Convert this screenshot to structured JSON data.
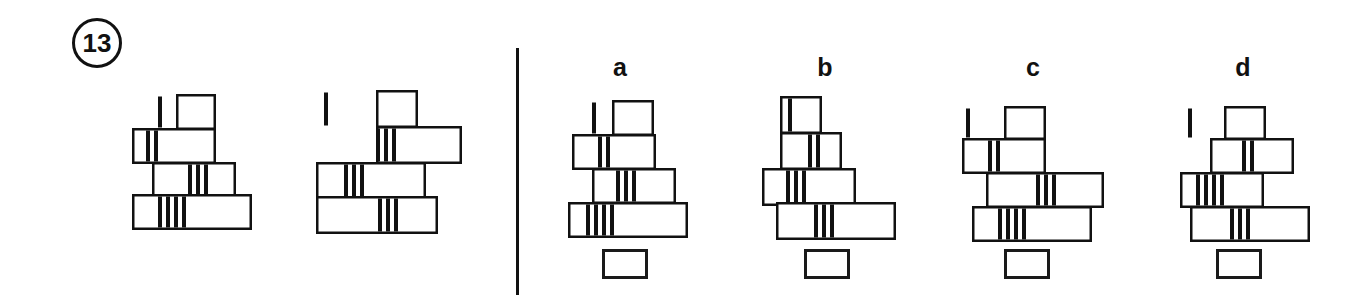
{
  "page": {
    "question_number": "13",
    "background_color": "#ffffff",
    "ink_color": "#111111",
    "width": 1368,
    "height": 295
  },
  "divider": {
    "x": 516,
    "y": 48,
    "width": 3,
    "height": 247
  },
  "question_marker": {
    "label": "13",
    "x": 72,
    "y": 18,
    "size": 50
  },
  "prompt": {
    "name": "prompt-figures",
    "figures": [
      {
        "name": "prompt-figure-1",
        "x": 128,
        "y": 94,
        "w": 132,
        "h": 132,
        "bricks": [
          {
            "name": "brick-top",
            "x": 48,
            "y": 0,
            "w": 40,
            "h": 36,
            "stripes": [
              30
            ]
          },
          {
            "name": "brick-second",
            "x": 4,
            "y": 34,
            "w": 84,
            "h": 36,
            "stripes": [
              18,
              26
            ]
          },
          {
            "name": "brick-third",
            "x": 24,
            "y": 68,
            "w": 84,
            "h": 36,
            "stripes": [
              60,
              68,
              76
            ]
          },
          {
            "name": "brick-bottom",
            "x": 4,
            "y": 100,
            "w": 120,
            "h": 36,
            "stripes": [
              30,
              38,
              46,
              54
            ]
          }
        ]
      },
      {
        "name": "prompt-figure-2",
        "x": 316,
        "y": 90,
        "w": 136,
        "h": 136,
        "bricks": [
          {
            "name": "brick-top",
            "x": 60,
            "y": 0,
            "w": 42,
            "h": 38,
            "stripes": [
              8
            ]
          },
          {
            "name": "brick-second",
            "x": 60,
            "y": 36,
            "w": 86,
            "h": 38,
            "stripes": [
              60,
              68,
              76
            ]
          },
          {
            "name": "brick-third",
            "x": 0,
            "y": 72,
            "w": 110,
            "h": 38,
            "stripes": [
              28,
              36,
              44
            ]
          },
          {
            "name": "brick-bottom",
            "x": 0,
            "y": 106,
            "w": 122,
            "h": 38,
            "stripes": [
              62,
              70,
              78
            ]
          }
        ]
      }
    ]
  },
  "options": [
    {
      "name": "option-a",
      "label": "a",
      "label_x": 605,
      "label_y": 55,
      "x": 568,
      "y": 100,
      "w": 130,
      "h": 130,
      "answer_box": {
        "x": 602,
        "y": 249,
        "w": 46,
        "h": 30
      },
      "bricks": [
        {
          "name": "brick-top",
          "x": 44,
          "y": 0,
          "w": 42,
          "h": 36,
          "stripes": [
            24
          ]
        },
        {
          "name": "brick-second",
          "x": 4,
          "y": 34,
          "w": 84,
          "h": 36,
          "stripes": [
            30,
            38
          ]
        },
        {
          "name": "brick-third",
          "x": 24,
          "y": 68,
          "w": 84,
          "h": 36,
          "stripes": [
            48,
            56,
            64
          ]
        },
        {
          "name": "brick-bottom",
          "x": 0,
          "y": 102,
          "w": 120,
          "h": 36,
          "stripes": [
            18,
            26,
            34,
            42
          ]
        }
      ]
    },
    {
      "name": "option-b",
      "label": "b",
      "label_x": 810,
      "label_y": 55,
      "x": 762,
      "y": 96,
      "w": 136,
      "h": 136,
      "answer_box": {
        "x": 804,
        "y": 249,
        "w": 46,
        "h": 30
      },
      "bricks": [
        {
          "name": "brick-top",
          "x": 18,
          "y": 0,
          "w": 42,
          "h": 38,
          "stripes": [
            26
          ]
        },
        {
          "name": "brick-second",
          "x": 18,
          "y": 36,
          "w": 62,
          "h": 38,
          "stripes": [
            46,
            54
          ]
        },
        {
          "name": "brick-third",
          "x": 0,
          "y": 72,
          "w": 94,
          "h": 38,
          "stripes": [
            24,
            32,
            40
          ]
        },
        {
          "name": "brick-bottom",
          "x": 14,
          "y": 106,
          "w": 120,
          "h": 38,
          "stripes": [
            52,
            60,
            68
          ]
        }
      ]
    },
    {
      "name": "option-c",
      "label": "c",
      "label_x": 1018,
      "label_y": 55,
      "x": 958,
      "y": 106,
      "w": 152,
      "h": 126,
      "answer_box": {
        "x": 1004,
        "y": 249,
        "w": 46,
        "h": 30
      },
      "bricks": [
        {
          "name": "brick-top",
          "x": 46,
          "y": 0,
          "w": 42,
          "h": 34,
          "stripes": [
            8
          ]
        },
        {
          "name": "brick-second",
          "x": 4,
          "y": 32,
          "w": 84,
          "h": 36,
          "stripes": [
            30,
            38
          ]
        },
        {
          "name": "brick-third",
          "x": 28,
          "y": 66,
          "w": 118,
          "h": 36,
          "stripes": [
            78,
            86,
            94
          ]
        },
        {
          "name": "brick-bottom",
          "x": 14,
          "y": 100,
          "w": 120,
          "h": 36,
          "stripes": [
            40,
            48,
            56,
            64
          ]
        }
      ]
    },
    {
      "name": "option-d",
      "label": "d",
      "label_x": 1228,
      "label_y": 55,
      "x": 1180,
      "y": 106,
      "w": 134,
      "h": 126,
      "answer_box": {
        "x": 1216,
        "y": 249,
        "w": 46,
        "h": 30
      },
      "bricks": [
        {
          "name": "brick-top",
          "x": 44,
          "y": 0,
          "w": 42,
          "h": 34,
          "stripes": [
            8
          ]
        },
        {
          "name": "brick-second",
          "x": 30,
          "y": 32,
          "w": 84,
          "h": 36,
          "stripes": [
            62,
            70
          ]
        },
        {
          "name": "brick-third",
          "x": 0,
          "y": 66,
          "w": 84,
          "h": 36,
          "stripes": [
            16,
            24,
            32,
            40
          ]
        },
        {
          "name": "brick-bottom",
          "x": 10,
          "y": 100,
          "w": 120,
          "h": 36,
          "stripes": [
            50,
            58,
            66
          ]
        }
      ]
    }
  ],
  "style": {
    "brick_fill": "#ffffff",
    "brick_stroke": "#111111",
    "brick_stroke_width": 2.5,
    "stripe_color": "#111111",
    "stripe_width": 4
  }
}
